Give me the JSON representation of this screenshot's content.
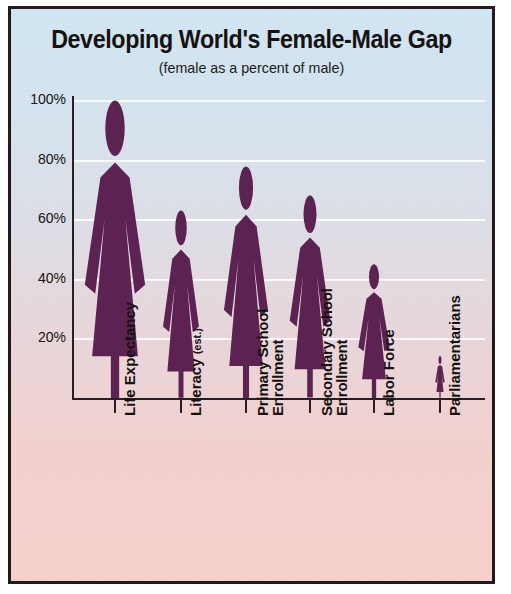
{
  "chart_data": {
    "type": "bar",
    "title": "Developing World's Female-Male Gap",
    "subtitle": "(female as a percent of male)",
    "xlabel": "",
    "ylabel": "",
    "ylim": [
      0,
      100
    ],
    "grid": true,
    "legend_position": "none",
    "unit": "%",
    "categories": [
      "Life Expectancy",
      "Literacy (est.)",
      "Primary School Enrollment",
      "Secondary School Enrollment",
      "Labor Force",
      "Parliamentarians"
    ],
    "values": [
      100,
      63,
      78,
      68,
      45,
      14
    ],
    "ticks": [
      "20%",
      "40%",
      "60%",
      "80%",
      "100%"
    ],
    "tick_values": [
      20,
      40,
      60,
      80,
      100
    ],
    "marker_style": "female-pictogram",
    "series_color": "#5C2352"
  },
  "categories_display": [
    {
      "line1": "Life Expectancy",
      "line2": "",
      "paren": ""
    },
    {
      "line1": "Literacy",
      "line2": "",
      "paren": "(est.)"
    },
    {
      "line1": "Primary School",
      "line2": "Enrollment",
      "paren": ""
    },
    {
      "line1": "Secondary School",
      "line2": "Enrollment",
      "paren": ""
    },
    {
      "line1": "Labor Force",
      "line2": "",
      "paren": ""
    },
    {
      "line1": "Parliamentarians",
      "line2": "",
      "paren": ""
    }
  ],
  "colors": {
    "figure": "#5C2352",
    "axis": "#2a2024",
    "text": "#16120f",
    "grid": "#ffffff",
    "bg_top": "#cfe4f2",
    "bg_bottom": "#f6cfca",
    "border": "#241a1c"
  }
}
